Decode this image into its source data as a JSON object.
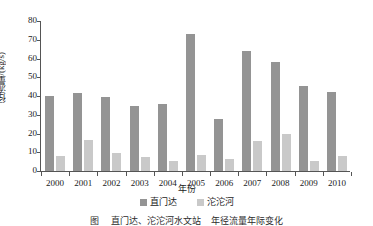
{
  "chart_data": {
    "type": "bar",
    "title": "",
    "xlabel": "年份",
    "ylabel": "径流量/(kg/s)",
    "categories": [
      "2000",
      "2001",
      "2002",
      "2003",
      "2004",
      "2005",
      "2006",
      "2007",
      "2008",
      "2009",
      "2010"
    ],
    "series": [
      {
        "name": "直门达",
        "color": "#949494",
        "values": [
          40.0,
          41.5,
          39.5,
          34.5,
          35.5,
          73.0,
          28.0,
          64.0,
          58.0,
          45.5,
          42.0
        ]
      },
      {
        "name": "沱沱河",
        "color": "#c9c9c9",
        "values": [
          8.0,
          16.5,
          9.5,
          7.5,
          5.5,
          8.5,
          6.5,
          16.0,
          20.0,
          5.5,
          8.0
        ]
      }
    ],
    "ylim": [
      0,
      80
    ],
    "yticks": [
      0,
      10,
      20,
      30,
      40,
      50,
      60,
      70,
      80
    ],
    "ytick_labels": [
      "0",
      "10",
      "20",
      "30",
      "40",
      "50",
      "60",
      "70",
      "80"
    ],
    "grid": false,
    "legend_position": "bottom"
  },
  "legend": {
    "items": [
      {
        "label": "直门达"
      },
      {
        "label": "沱沱河"
      }
    ]
  },
  "caption": {
    "figure_number": "图 ",
    "text": "直门达、沱沱河水文站",
    "text2": "年径流量年际变化"
  }
}
